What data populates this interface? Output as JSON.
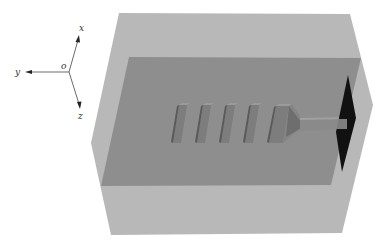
{
  "diagram": {
    "type": "3d-simulation-domain",
    "axes": {
      "origin_label": "o",
      "labels": {
        "up": "x",
        "left": "y",
        "down": "z"
      }
    },
    "components": {
      "outer_box": "simulation-region",
      "inner_plane": "substrate-plane",
      "grating_bars": 5,
      "taper": "taper",
      "waveguide": "waveguide",
      "source": "source-plane"
    },
    "colors": {
      "background": "#ffffff",
      "outer_box": "#b8b8b8",
      "inner_plane": "#8e8e8e",
      "bar_front": "#7d7d7d",
      "bar_side": "#5a5a5a",
      "bar_top": "#9a9a9a",
      "source": "#111111",
      "axis": "#444444"
    }
  }
}
